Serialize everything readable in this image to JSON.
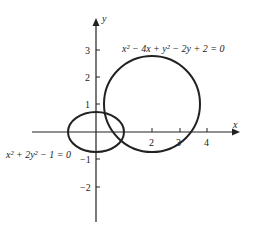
{
  "figure": {
    "axes": {
      "x_label": "x",
      "y_label": "y",
      "x_ticks": [
        "2",
        "3",
        "4"
      ],
      "y_ticks": [
        "3",
        "2",
        "1",
        "−1",
        "−2"
      ]
    },
    "curves": [
      {
        "name": "circle",
        "equation": "x² − 4x + y² − 2y + 2 = 0",
        "center": [
          2,
          1
        ],
        "radius": 1.732
      },
      {
        "name": "ellipse",
        "equation": "x² + 2y² − 1 = 0",
        "center": [
          0,
          0
        ],
        "semi_axes": [
          1,
          0.707
        ]
      }
    ],
    "colors": {
      "stroke": "#222222",
      "background": "#ffffff"
    }
  }
}
